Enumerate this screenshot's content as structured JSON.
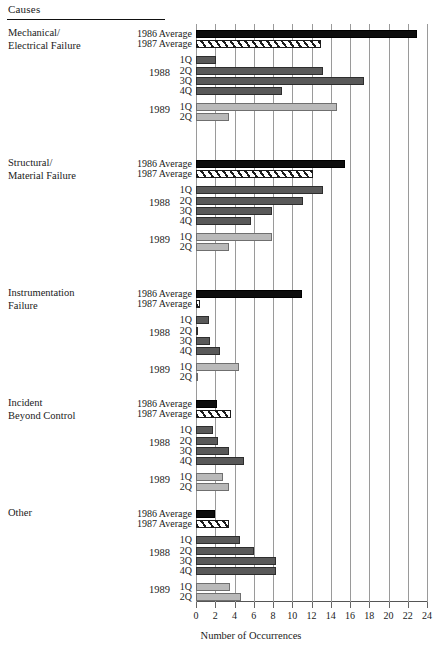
{
  "header": {
    "causes_label": "Causes"
  },
  "axis": {
    "title": "Number of Occurrences",
    "ticks": [
      0,
      2,
      4,
      6,
      8,
      10,
      12,
      14,
      16,
      18,
      20,
      22,
      24
    ],
    "min": 0,
    "max": 24
  },
  "series_labels": {
    "avg1986": "1986 Average",
    "avg1987": "1987 Average",
    "year1988": "1988",
    "year1989": "1989",
    "q1": "1Q",
    "q2": "2Q",
    "q3": "3Q",
    "q4": "4Q"
  },
  "colors": {
    "avg1986": "#0d0d0d",
    "avg1987": "#ffffff",
    "quarters1988": "#595959",
    "quarters1989": "#b9b9b9",
    "gridline": "#9a9a9a"
  },
  "chart_data": {
    "type": "bar",
    "orientation": "horizontal",
    "title": "Causes",
    "xlabel": "Number of Occurrences",
    "ylabel": "Causes",
    "xlim": [
      0,
      24
    ],
    "xticks": [
      0,
      2,
      4,
      6,
      8,
      10,
      12,
      14,
      16,
      18,
      20,
      22,
      24
    ],
    "grid": "vertical",
    "legend": "none",
    "categories": [
      "Mechanical/ Electrical Failure",
      "Structural/ Material Failure",
      "Instrumentation Failure",
      "Incident Beyond Control",
      "Other"
    ],
    "series": [
      {
        "name": "1986 Average",
        "values": [
          23.0,
          15.5,
          11.0,
          2.2,
          2.0
        ]
      },
      {
        "name": "1987 Average",
        "values": [
          13.0,
          12.2,
          0.4,
          3.6,
          3.4
        ]
      },
      {
        "name": "1988 1Q",
        "values": [
          2.1,
          13.2,
          1.4,
          1.8,
          4.6
        ]
      },
      {
        "name": "1988 2Q",
        "values": [
          13.2,
          11.1,
          0.2,
          2.3,
          6.0
        ]
      },
      {
        "name": "1988 3Q",
        "values": [
          17.5,
          7.9,
          1.5,
          3.4,
          8.3
        ]
      },
      {
        "name": "1988 4Q",
        "values": [
          8.9,
          5.7,
          2.5,
          5.0,
          8.3
        ]
      },
      {
        "name": "1989 1Q",
        "values": [
          14.6,
          7.9,
          4.5,
          2.8,
          3.5
        ]
      },
      {
        "name": "1989 2Q",
        "values": [
          3.4,
          3.4,
          0.2,
          3.4,
          4.7
        ]
      }
    ],
    "groups": [
      {
        "category_line1": "Mechanical/",
        "category_line2": "Electrical Failure",
        "bars": [
          {
            "label": "1986 Average",
            "value": 23.0,
            "style": "avg86"
          },
          {
            "label": "1987 Average",
            "value": 13.0,
            "style": "avg87"
          },
          {
            "label": "1Q",
            "value": 2.1,
            "style": "q88"
          },
          {
            "label": "2Q",
            "value": 13.2,
            "style": "q88"
          },
          {
            "label": "3Q",
            "value": 17.5,
            "style": "q88"
          },
          {
            "label": "4Q",
            "value": 8.9,
            "style": "q88"
          },
          {
            "label": "1Q",
            "value": 14.6,
            "style": "q89"
          },
          {
            "label": "2Q",
            "value": 3.4,
            "style": "q89"
          }
        ]
      },
      {
        "category_line1": "Structural/",
        "category_line2": "Material Failure",
        "bars": [
          {
            "label": "1986 Average",
            "value": 15.5,
            "style": "avg86"
          },
          {
            "label": "1987 Average",
            "value": 12.2,
            "style": "avg87"
          },
          {
            "label": "1Q",
            "value": 13.2,
            "style": "q88"
          },
          {
            "label": "2Q",
            "value": 11.1,
            "style": "q88"
          },
          {
            "label": "3Q",
            "value": 7.9,
            "style": "q88"
          },
          {
            "label": "4Q",
            "value": 5.7,
            "style": "q88"
          },
          {
            "label": "1Q",
            "value": 7.9,
            "style": "q89"
          },
          {
            "label": "2Q",
            "value": 3.4,
            "style": "q89"
          }
        ]
      },
      {
        "category_line1": "Instrumentation",
        "category_line2": "Failure",
        "bars": [
          {
            "label": "1986 Average",
            "value": 11.0,
            "style": "avg86"
          },
          {
            "label": "1987 Average",
            "value": 0.4,
            "style": "avg87"
          },
          {
            "label": "1Q",
            "value": 1.4,
            "style": "q88"
          },
          {
            "label": "2Q",
            "value": 0.2,
            "style": "q88"
          },
          {
            "label": "3Q",
            "value": 1.5,
            "style": "q88"
          },
          {
            "label": "4Q",
            "value": 2.5,
            "style": "q88"
          },
          {
            "label": "1Q",
            "value": 4.5,
            "style": "q89"
          },
          {
            "label": "2Q",
            "value": 0.2,
            "style": "q89"
          }
        ]
      },
      {
        "category_line1": "Incident",
        "category_line2": "Beyond Control",
        "bars": [
          {
            "label": "1986 Average",
            "value": 2.2,
            "style": "avg86"
          },
          {
            "label": "1987 Average",
            "value": 3.6,
            "style": "avg87"
          },
          {
            "label": "1Q",
            "value": 1.8,
            "style": "q88"
          },
          {
            "label": "2Q",
            "value": 2.3,
            "style": "q88"
          },
          {
            "label": "3Q",
            "value": 3.4,
            "style": "q88"
          },
          {
            "label": "4Q",
            "value": 5.0,
            "style": "q88"
          },
          {
            "label": "1Q",
            "value": 2.8,
            "style": "q89"
          },
          {
            "label": "2Q",
            "value": 3.4,
            "style": "q89"
          }
        ]
      },
      {
        "category_line1": "Other",
        "category_line2": "",
        "bars": [
          {
            "label": "1986 Average",
            "value": 2.0,
            "style": "avg86"
          },
          {
            "label": "1987 Average",
            "value": 3.4,
            "style": "avg87"
          },
          {
            "label": "1Q",
            "value": 4.6,
            "style": "q88"
          },
          {
            "label": "2Q",
            "value": 6.0,
            "style": "q88"
          },
          {
            "label": "3Q",
            "value": 8.3,
            "style": "q88"
          },
          {
            "label": "4Q",
            "value": 8.3,
            "style": "q88"
          },
          {
            "label": "1Q",
            "value": 3.5,
            "style": "q89"
          },
          {
            "label": "2Q",
            "value": 4.7,
            "style": "q89"
          }
        ]
      }
    ]
  }
}
